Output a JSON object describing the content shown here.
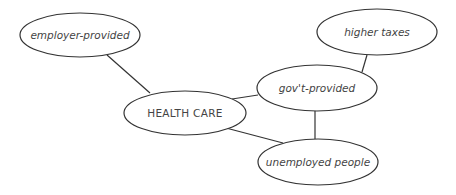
{
  "diagram": {
    "type": "concept-map",
    "nodes": [
      {
        "id": "employer",
        "label": "employer-provided",
        "cx": 80,
        "cy": 35,
        "rx": 60,
        "ry": 22
      },
      {
        "id": "taxes",
        "label": "higher taxes",
        "cx": 377,
        "cy": 32,
        "rx": 60,
        "ry": 23
      },
      {
        "id": "gov",
        "label": "gov't-provided",
        "cx": 317,
        "cy": 88,
        "rx": 60,
        "ry": 23
      },
      {
        "id": "health",
        "label": "HEALTH CARE",
        "cx": 185,
        "cy": 113,
        "rx": 61,
        "ry": 22
      },
      {
        "id": "unemployed",
        "label": "unemployed people",
        "cx": 318,
        "cy": 162,
        "rx": 60,
        "ry": 23
      }
    ],
    "edges": [
      {
        "from": "employer",
        "to": "health"
      },
      {
        "from": "health",
        "to": "gov"
      },
      {
        "from": "gov",
        "to": "taxes"
      },
      {
        "from": "gov",
        "to": "unemployed"
      },
      {
        "from": "health",
        "to": "unemployed"
      }
    ]
  }
}
